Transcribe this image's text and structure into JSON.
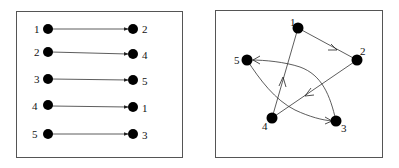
{
  "left_panel": {
    "description": "Permutation as a mapping",
    "rows": [
      {
        "from": "1",
        "to": "2"
      },
      {
        "from": "2",
        "to": "4"
      },
      {
        "from": "3",
        "to": "5"
      },
      {
        "from": "4",
        "to": "1"
      },
      {
        "from": "5",
        "to": "3"
      }
    ]
  },
  "right_panel": {
    "description": "Permutation as a cycle graph",
    "nodes": [
      {
        "id": "1",
        "label": "1"
      },
      {
        "id": "2",
        "label": "2"
      },
      {
        "id": "3",
        "label": "3"
      },
      {
        "id": "4",
        "label": "4"
      },
      {
        "id": "5",
        "label": "5"
      }
    ],
    "edges": [
      {
        "from": "1",
        "to": "2"
      },
      {
        "from": "2",
        "to": "4"
      },
      {
        "from": "4",
        "to": "1"
      },
      {
        "from": "3",
        "to": "5"
      },
      {
        "from": "5",
        "to": "3"
      }
    ]
  },
  "colors": {
    "node": "#000000",
    "edge": "#333333",
    "frame": "#555555"
  }
}
